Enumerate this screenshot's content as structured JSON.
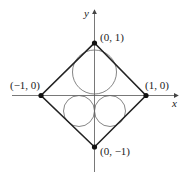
{
  "diagram": {
    "axes": {
      "x_label": "x",
      "y_label": "y"
    },
    "points": [
      {
        "label": "(0, 1)",
        "x": 0,
        "y": 1
      },
      {
        "label": "(1, 0)",
        "x": 1,
        "y": 0
      },
      {
        "label": "(−1, 0)",
        "x": -1,
        "y": 0
      },
      {
        "label": "(0, −1)",
        "x": 0,
        "y": -1
      }
    ],
    "shapes": [
      "square with vertices on axes",
      "upper circle inscribed in top triangle",
      "two lower circles tangent"
    ],
    "colors": {
      "line": "#222222",
      "circle": "#555555",
      "background": "#ffffff"
    }
  }
}
